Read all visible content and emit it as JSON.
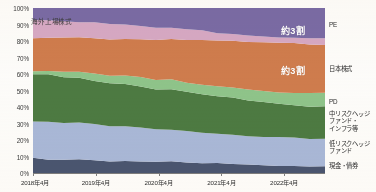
{
  "chart_data": {
    "type": "area",
    "title": "",
    "subtitle": "",
    "xlabel": "",
    "ylabel": "",
    "stacked": true,
    "normalized_percent": true,
    "grid": false,
    "legend_position": "right",
    "ylim": [
      0,
      100
    ],
    "y_ticks": [
      "0%",
      "10%",
      "20%",
      "30%",
      "40%",
      "50%",
      "60%",
      "70%",
      "80%",
      "90%",
      "100%"
    ],
    "y_tick_values": [
      0,
      10,
      20,
      30,
      40,
      50,
      60,
      70,
      80,
      90,
      100
    ],
    "x_tick_labels": [
      "2018年4月",
      "2019年4月",
      "2020年4月",
      "2021年4月",
      "2022年4月"
    ],
    "x_tick_values": [
      2018.25,
      2019.25,
      2020.25,
      2021.25,
      2022.25
    ],
    "x_range": [
      2018.25,
      2022.9
    ],
    "x": [
      2018.25,
      2018.5,
      2018.75,
      2019.0,
      2019.25,
      2019.5,
      2019.75,
      2020.0,
      2020.25,
      2020.5,
      2020.75,
      2021.0,
      2021.25,
      2021.5,
      2021.75,
      2022.0,
      2022.25,
      2022.5,
      2022.75,
      2022.9
    ],
    "series": [
      {
        "name": "現金・債券",
        "color": "#4a5570",
        "values": [
          9.0,
          8.2,
          7.8,
          8.4,
          7.6,
          7.0,
          7.4,
          6.8,
          6.2,
          6.6,
          6.0,
          5.6,
          5.4,
          5.2,
          4.8,
          4.6,
          4.4,
          4.2,
          4.0,
          4.0
        ]
      },
      {
        "name": "低リスクヘッジファンド",
        "color": "#a9b8d8",
        "values": [
          22.0,
          22.4,
          22.0,
          21.6,
          21.4,
          21.0,
          20.6,
          20.2,
          19.8,
          19.6,
          19.2,
          18.8,
          18.4,
          18.0,
          17.6,
          17.2,
          16.8,
          16.6,
          16.4,
          16.4
        ]
      },
      {
        "name": "中リスクヘッジファンド・インフラ等",
        "color": "#4d7a42",
        "values": [
          28.0,
          28.4,
          28.2,
          27.6,
          27.0,
          26.4,
          26.0,
          25.4,
          24.6,
          24.0,
          23.4,
          23.0,
          22.4,
          21.8,
          21.2,
          20.8,
          20.4,
          20.2,
          20.0,
          20.0
        ]
      },
      {
        "name": "PD",
        "color": "#8fc48a",
        "values": [
          2.5,
          2.8,
          3.2,
          3.4,
          3.8,
          4.2,
          4.6,
          5.0,
          5.4,
          5.8,
          6.0,
          6.2,
          6.4,
          6.6,
          6.8,
          7.0,
          7.2,
          7.4,
          7.4,
          7.4
        ]
      },
      {
        "name": "日本株式",
        "color": "#cf7c4d",
        "values": [
          19.5,
          19.8,
          20.4,
          21.0,
          21.6,
          22.2,
          22.8,
          23.6,
          24.4,
          25.2,
          26.0,
          26.6,
          27.2,
          27.8,
          28.4,
          29.0,
          29.4,
          29.8,
          30.0,
          30.0
        ]
      },
      {
        "name": "海外上場株式",
        "color": "#d6a8c4",
        "values": [
          11.5,
          10.8,
          10.2,
          9.6,
          9.2,
          8.8,
          8.2,
          7.8,
          7.2,
          6.6,
          6.2,
          5.8,
          5.2,
          4.8,
          4.4,
          4.2,
          4.0,
          3.8,
          3.6,
          3.6
        ]
      },
      {
        "name": "PE",
        "color": "#7a6ba5",
        "values": [
          7.5,
          7.6,
          8.2,
          8.4,
          9.4,
          10.4,
          10.4,
          11.2,
          12.4,
          12.2,
          13.2,
          14.0,
          15.0,
          15.8,
          16.8,
          17.2,
          17.8,
          18.0,
          18.6,
          18.6
        ]
      }
    ],
    "legend_entries": [
      {
        "label": "PE",
        "color": "#7a6ba5"
      },
      {
        "label": "日本株式",
        "color": "#cf7c4d"
      },
      {
        "label": "PD",
        "color": "#8fc48a"
      },
      {
        "label": "中リスクヘッジ\nファンド・\nインフラ等",
        "color": "#4d7a42"
      },
      {
        "label": "低リスクヘッジ\nファンド",
        "color": "#a9b8d8"
      },
      {
        "label": "現金・債券",
        "color": "#4a5570"
      }
    ],
    "annotations": [
      {
        "text": "海外上場株式",
        "series": "海外上場株式",
        "color": "#3b3b3b"
      },
      {
        "text": "約3割",
        "series": "PE",
        "color": "#ffffff"
      },
      {
        "text": "約3割",
        "series": "日本株式",
        "color": "#ffffff"
      }
    ]
  }
}
